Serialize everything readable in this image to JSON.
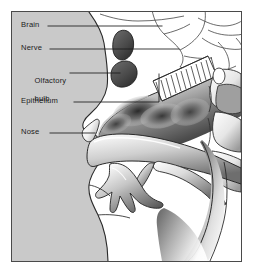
{
  "figure": {
    "type": "anatomical-diagram",
    "background_color": "#c9c9c9",
    "border_color": "#4a4a4a",
    "page_color": "#ffffff",
    "ink_color": "#1b1b1b"
  },
  "labels": [
    {
      "id": "brain",
      "text": "Brain",
      "leader": {
        "x1": 36,
        "y1": 14,
        "x2": 150,
        "y2": 14
      }
    },
    {
      "id": "nerve",
      "text": "Nerve",
      "leader": {
        "x1": 38,
        "y1": 37,
        "x2": 167,
        "y2": 37
      }
    },
    {
      "id": "olfactory_bulb",
      "line1": "Olfactory",
      "line2": "bulb",
      "text": "Olfactory bulb",
      "leader": {
        "x1": 58,
        "y1": 61,
        "x2": 108,
        "y2": 61
      }
    },
    {
      "id": "epithelium",
      "text": "Epithelium",
      "leader_h": {
        "x1": 62,
        "y1": 90,
        "x2": 147,
        "y2": 90
      },
      "leader_v": {
        "x1": 147,
        "y1": 90,
        "x2": 147,
        "y2": 62
      }
    },
    {
      "id": "nose",
      "text": "Nose",
      "leader": {
        "x1": 38,
        "y1": 121,
        "x2": 83,
        "y2": 121
      }
    }
  ],
  "structures": [
    {
      "id": "frontal-sinus",
      "name": "Frontal sinus"
    },
    {
      "id": "olfactory-bulb-shape",
      "name": "Olfactory bulb"
    },
    {
      "id": "cribriform-plate",
      "name": "Cribriform plate"
    },
    {
      "id": "nasal-cavity",
      "name": "Nasal cavity"
    },
    {
      "id": "olfactory-epithelium",
      "name": "Olfactory epithelium"
    },
    {
      "id": "hard-palate",
      "name": "Hard palate"
    },
    {
      "id": "tongue",
      "name": "Tongue"
    },
    {
      "id": "soft-palate",
      "name": "Soft palate"
    },
    {
      "id": "pharynx",
      "name": "Pharynx"
    },
    {
      "id": "cervical-vertebrae",
      "name": "Cervical vertebrae"
    },
    {
      "id": "intervertebral-disc",
      "name": "Intervertebral disc"
    },
    {
      "id": "cranial-base",
      "name": "Cranial base"
    },
    {
      "id": "mandible",
      "name": "Mandible"
    },
    {
      "id": "face-profile",
      "name": "Facial profile"
    }
  ]
}
